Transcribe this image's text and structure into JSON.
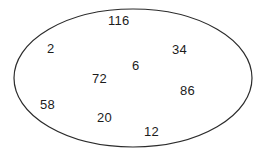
{
  "diagram": {
    "type": "set-ellipse-number-diagram",
    "shape": {
      "name": "ellipse",
      "stroke_color": "#2b2b2b",
      "fill_color": "#ffffff",
      "stroke_width": 1.2,
      "center_x": 133,
      "center_y": 78,
      "radius_x": 119,
      "radius_y": 69
    },
    "background_color": "#ffffff",
    "text_color": "#1c1c1c",
    "elements": [
      {
        "label": "116",
        "x": 108,
        "y": 14
      },
      {
        "label": "2",
        "x": 47,
        "y": 42
      },
      {
        "label": "34",
        "x": 172,
        "y": 43
      },
      {
        "label": "6",
        "x": 132,
        "y": 59
      },
      {
        "label": "72",
        "x": 92,
        "y": 72
      },
      {
        "label": "86",
        "x": 180,
        "y": 84
      },
      {
        "label": "58",
        "x": 40,
        "y": 98
      },
      {
        "label": "20",
        "x": 97,
        "y": 111
      },
      {
        "label": "12",
        "x": 144,
        "y": 125
      }
    ]
  }
}
